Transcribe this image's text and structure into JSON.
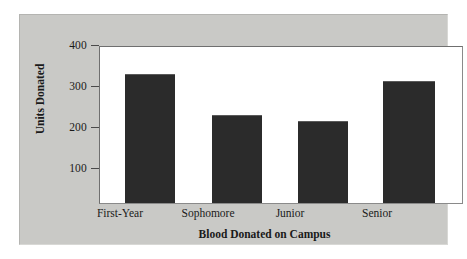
{
  "chart_data": {
    "type": "bar",
    "title": "",
    "xlabel": "Blood Donated on Campus",
    "ylabel": "Units Donated",
    "categories": [
      "First-Year",
      "Sophomore",
      "Junior",
      "Senior"
    ],
    "values": [
      350,
      255,
      240,
      335
    ],
    "yticks": [
      100,
      200,
      300,
      400
    ],
    "ytick_labels": [
      "100",
      "200",
      "300",
      "400"
    ],
    "ylim": [
      46,
      415
    ],
    "grid": false,
    "legend": null,
    "bar_color": "#2b2b2b",
    "plot_background": "#ffffff",
    "figure_background": "#c9c9c6",
    "axis_color": "#4a4a4a"
  },
  "figure": {
    "y_title": "Units Donated",
    "x_title": "Blood Donated on Campus",
    "ytick_0": "100",
    "ytick_1": "200",
    "ytick_2": "300",
    "ytick_3": "400",
    "cat_0": "First-Year",
    "cat_1": "Sophomore",
    "cat_2": "Junior",
    "cat_3": "Senior"
  }
}
